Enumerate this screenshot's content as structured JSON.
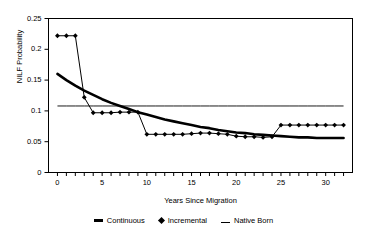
{
  "chart_data": {
    "type": "line",
    "title": "",
    "xlabel": "Years Since Migration",
    "ylabel": "NILF Probability",
    "xlim": [
      -1,
      33
    ],
    "ylim": [
      0,
      0.25
    ],
    "grid": false,
    "legend_position": "bottom",
    "xticks": [
      0,
      5,
      10,
      15,
      20,
      25,
      30
    ],
    "xtick_labels": [
      "0",
      "5",
      "10",
      "15",
      "20",
      "25",
      "30"
    ],
    "yticks": [
      0,
      0.05,
      0.1,
      0.15,
      0.2,
      0.25
    ],
    "ytick_labels": [
      "0",
      "0.05",
      "0.1",
      "0.15",
      "0.2",
      "0.25"
    ],
    "x": [
      0,
      1,
      2,
      3,
      4,
      5,
      6,
      7,
      8,
      9,
      10,
      11,
      12,
      13,
      14,
      15,
      16,
      17,
      18,
      19,
      20,
      21,
      22,
      23,
      24,
      25,
      26,
      27,
      28,
      29,
      30,
      31,
      32
    ],
    "series": [
      {
        "name": "Continuous",
        "style": "thick-line",
        "marker": "none",
        "color": "#000000",
        "values": [
          0.16,
          0.15,
          0.141,
          0.133,
          0.126,
          0.119,
          0.113,
          0.108,
          0.103,
          0.098,
          0.094,
          0.09,
          0.086,
          0.083,
          0.08,
          0.077,
          0.074,
          0.072,
          0.069,
          0.067,
          0.065,
          0.064,
          0.062,
          0.061,
          0.06,
          0.059,
          0.058,
          0.057,
          0.057,
          0.056,
          0.056,
          0.056,
          0.056
        ]
      },
      {
        "name": "Incremental",
        "style": "thin-line-with-markers",
        "marker": "diamond",
        "color": "#000000",
        "values": [
          0.222,
          0.222,
          0.222,
          0.122,
          0.097,
          0.097,
          0.097,
          0.098,
          0.098,
          0.098,
          0.062,
          0.062,
          0.062,
          0.062,
          0.062,
          0.063,
          0.064,
          0.064,
          0.063,
          0.062,
          0.059,
          0.058,
          0.058,
          0.057,
          0.058,
          0.077,
          0.077,
          0.077,
          0.077,
          0.077,
          0.077,
          0.077,
          0.077
        ]
      },
      {
        "name": "Native Born",
        "style": "thin-line",
        "marker": "none",
        "color": "#000000",
        "constant_value": 0.108,
        "values": [
          0.108,
          0.108,
          0.108,
          0.108,
          0.108,
          0.108,
          0.108,
          0.108,
          0.108,
          0.108,
          0.108,
          0.108,
          0.108,
          0.108,
          0.108,
          0.108,
          0.108,
          0.108,
          0.108,
          0.108,
          0.108,
          0.108,
          0.108,
          0.108,
          0.108,
          0.108,
          0.108,
          0.108,
          0.108,
          0.108,
          0.108,
          0.108,
          0.108
        ]
      }
    ]
  },
  "legend": {
    "items": [
      {
        "label": "Continuous",
        "marker": "thick-line"
      },
      {
        "label": "Incremental",
        "marker": "diamond"
      },
      {
        "label": "Native Born",
        "marker": "thin-line"
      }
    ]
  }
}
